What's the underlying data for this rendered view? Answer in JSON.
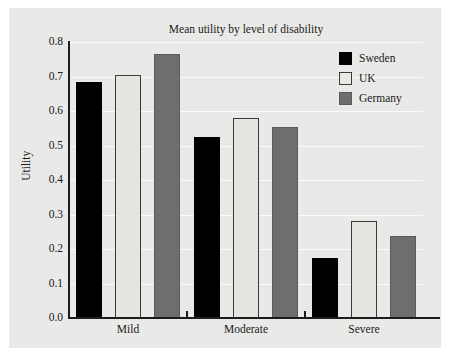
{
  "chart_data": {
    "type": "bar",
    "title": "Mean utility by level of disability",
    "xlabel": "",
    "ylabel": "Utility",
    "categories": [
      "Mild",
      "Moderate",
      "Severe"
    ],
    "series": [
      {
        "name": "Sweden",
        "color": "#000000",
        "values": [
          0.685,
          0.525,
          0.175
        ]
      },
      {
        "name": "UK",
        "color": "#e8e8e4",
        "values": [
          0.705,
          0.58,
          0.28
        ]
      },
      {
        "name": "Germany",
        "color": "#6e6e6e",
        "values": [
          0.765,
          0.553,
          0.238
        ]
      }
    ],
    "ylim": [
      0.0,
      0.8
    ],
    "ytick_labels": [
      "0.0",
      "0.1",
      "0.2",
      "0.3",
      "0.4",
      "0.5",
      "0.6",
      "0.7",
      "0.8"
    ],
    "ytick_values": [
      0.0,
      0.1,
      0.2,
      0.3,
      0.4,
      0.5,
      0.6,
      0.7,
      0.8
    ],
    "grid": "horizontal",
    "legend_position": "top-right",
    "background_color": "#e9e9e7",
    "gridline_color": "#fbfbfa",
    "axis_color": "#1c1c1c"
  }
}
